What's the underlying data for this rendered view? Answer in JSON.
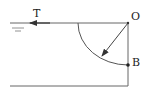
{
  "diagram": {
    "labels": {
      "tension": "T",
      "hinge": "O",
      "point_b": "B"
    },
    "colors": {
      "line": "#555555",
      "text": "#222222",
      "background": "#ffffff"
    }
  }
}
